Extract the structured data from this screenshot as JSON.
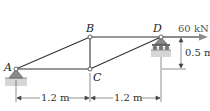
{
  "diagram": {
    "type": "truss",
    "joints": [
      {
        "id": "A",
        "label": "A",
        "x": 16,
        "y": 69,
        "support": "pin"
      },
      {
        "id": "B",
        "label": "B",
        "x": 90,
        "y": 37
      },
      {
        "id": "C",
        "label": "C",
        "x": 90,
        "y": 69
      },
      {
        "id": "D",
        "label": "D",
        "x": 161,
        "y": 37,
        "support": "roller"
      }
    ],
    "members": [
      [
        "A",
        "B"
      ],
      [
        "A",
        "C"
      ],
      [
        "B",
        "C"
      ],
      [
        "B",
        "D"
      ],
      [
        "C",
        "D"
      ]
    ],
    "load": {
      "at": "D",
      "label": "60 kN",
      "direction": "right",
      "color": "#7a7a7a"
    },
    "dimensions": {
      "horizontal": [
        {
          "label": "1.2 m",
          "from": "A",
          "to": "C"
        },
        {
          "label": "1.2 m",
          "from": "C",
          "to": "D"
        }
      ],
      "vertical": {
        "label": "0.5 m",
        "from": "D",
        "to": "C"
      }
    },
    "colors": {
      "member": "#333333",
      "support": "#8a8a8a",
      "ground": "#bdbdbd",
      "arrow": "#8c8c8c"
    }
  }
}
